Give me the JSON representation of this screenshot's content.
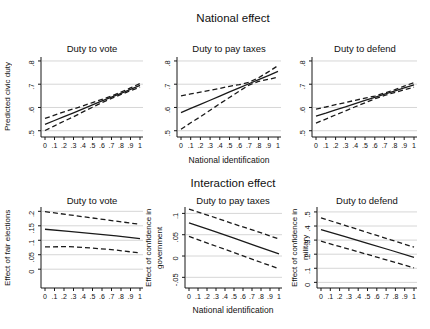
{
  "titles": {
    "national": "National effect",
    "interaction": "Interaction effect"
  },
  "colors": {
    "line": "#1a1a1a",
    "axis": "#161616",
    "grid": "#d6d6d6",
    "background": "#ffffff",
    "text": "#111111"
  },
  "chart_data": [
    {
      "id": "national-duty-to-vote",
      "type": "line",
      "group": "National effect",
      "title": "Duty to vote",
      "ylabel": "Predicted civic duty",
      "ylabel_lines": [
        "Predicted civic duty"
      ],
      "xlabel": "",
      "x": [
        0,
        0.1,
        0.2,
        0.3,
        0.4,
        0.5,
        0.6,
        0.7,
        0.8,
        0.9,
        1
      ],
      "series": [
        {
          "name": "point-estimate",
          "style": "solid",
          "values": [
            0.527,
            0.544,
            0.561,
            0.577,
            0.594,
            0.611,
            0.628,
            0.644,
            0.661,
            0.678,
            0.695
          ]
        },
        {
          "name": "upper-ci",
          "style": "dashed",
          "values": [
            0.553,
            0.567,
            0.581,
            0.594,
            0.607,
            0.621,
            0.635,
            0.649,
            0.666,
            0.684,
            0.703
          ]
        },
        {
          "name": "lower-ci",
          "style": "dashed",
          "values": [
            0.501,
            0.521,
            0.541,
            0.56,
            0.581,
            0.601,
            0.621,
            0.639,
            0.656,
            0.672,
            0.687
          ]
        }
      ],
      "ylim": [
        0.473,
        0.817
      ],
      "yticks": [
        0.5,
        0.6,
        0.7,
        0.8
      ],
      "ytick_labels": [
        ".5",
        ".6",
        ".7",
        ".8"
      ],
      "xticks": [
        0,
        0.1,
        0.2,
        0.3,
        0.4,
        0.5,
        0.6,
        0.7,
        0.8,
        0.9,
        1
      ],
      "xtick_labels": [
        "0",
        ".1",
        ".2",
        ".3",
        ".4",
        ".5",
        ".6",
        ".7",
        ".8",
        ".9",
        "1"
      ],
      "grid": true
    },
    {
      "id": "national-duty-to-pay-taxes",
      "type": "line",
      "group": "National effect",
      "title": "Duty to pay taxes",
      "ylabel": "",
      "ylabel_lines": [],
      "xlabel": "National identification",
      "x": [
        0,
        0.1,
        0.2,
        0.3,
        0.4,
        0.5,
        0.6,
        0.7,
        0.8,
        0.9,
        1
      ],
      "series": [
        {
          "name": "point-estimate",
          "style": "solid",
          "values": [
            0.578,
            0.596,
            0.613,
            0.631,
            0.649,
            0.667,
            0.684,
            0.702,
            0.72,
            0.737,
            0.755
          ]
        },
        {
          "name": "upper-ci",
          "style": "dashed",
          "values": [
            0.65,
            0.658,
            0.666,
            0.674,
            0.682,
            0.691,
            0.698,
            0.708,
            0.728,
            0.753,
            0.78
          ]
        },
        {
          "name": "lower-ci",
          "style": "dashed",
          "values": [
            0.506,
            0.534,
            0.56,
            0.588,
            0.616,
            0.643,
            0.67,
            0.696,
            0.712,
            0.721,
            0.73
          ]
        }
      ],
      "ylim": [
        0.473,
        0.817
      ],
      "yticks": [
        0.5,
        0.6,
        0.7,
        0.8
      ],
      "ytick_labels": [
        ".5",
        ".6",
        ".7",
        ".8"
      ],
      "xticks": [
        0,
        0.1,
        0.2,
        0.3,
        0.4,
        0.5,
        0.6,
        0.7,
        0.8,
        0.9,
        1
      ],
      "xtick_labels": [
        "0",
        ".1",
        ".2",
        ".3",
        ".4",
        ".5",
        ".6",
        ".7",
        ".8",
        ".9",
        "1"
      ],
      "grid": true
    },
    {
      "id": "national-duty-to-defend",
      "type": "line",
      "group": "National effect",
      "title": "Duty to defend",
      "ylabel": "",
      "ylabel_lines": [],
      "xlabel": "",
      "x": [
        0,
        0.1,
        0.2,
        0.3,
        0.4,
        0.5,
        0.6,
        0.7,
        0.8,
        0.9,
        1
      ],
      "series": [
        {
          "name": "point-estimate",
          "style": "solid",
          "values": [
            0.563,
            0.576,
            0.59,
            0.603,
            0.617,
            0.63,
            0.643,
            0.657,
            0.67,
            0.684,
            0.697
          ]
        },
        {
          "name": "upper-ci",
          "style": "dashed",
          "values": [
            0.593,
            0.602,
            0.612,
            0.621,
            0.631,
            0.64,
            0.649,
            0.662,
            0.676,
            0.692,
            0.707
          ]
        },
        {
          "name": "lower-ci",
          "style": "dashed",
          "values": [
            0.533,
            0.55,
            0.568,
            0.585,
            0.603,
            0.62,
            0.637,
            0.652,
            0.664,
            0.676,
            0.687
          ]
        }
      ],
      "ylim": [
        0.473,
        0.817
      ],
      "yticks": [
        0.5,
        0.6,
        0.7,
        0.8
      ],
      "ytick_labels": [
        ".5",
        ".6",
        ".7",
        ".8"
      ],
      "xticks": [
        0,
        0.1,
        0.2,
        0.3,
        0.4,
        0.5,
        0.6,
        0.7,
        0.8,
        0.9,
        1
      ],
      "xtick_labels": [
        "0",
        ".1",
        ".2",
        ".3",
        ".4",
        ".5",
        ".6",
        ".7",
        ".8",
        ".9",
        "1"
      ],
      "grid": true
    },
    {
      "id": "interaction-duty-to-vote",
      "type": "line",
      "group": "Interaction effect",
      "title": "Duty to vote",
      "ylabel": "Effect of fair elections",
      "ylabel_lines": [
        "Effect of fair elections"
      ],
      "xlabel": "",
      "x": [
        0,
        0.25,
        0.5,
        0.75,
        1
      ],
      "series": [
        {
          "name": "point-estimate",
          "style": "solid",
          "values": [
            0.138,
            0.131,
            0.123,
            0.115,
            0.106
          ]
        },
        {
          "name": "upper-ci",
          "style": "dashed",
          "values": [
            0.199,
            0.188,
            0.177,
            0.166,
            0.155
          ]
        },
        {
          "name": "lower-ci",
          "style": "dashed",
          "values": [
            0.077,
            0.078,
            0.073,
            0.066,
            0.056
          ]
        }
      ],
      "ylim": [
        -0.065,
        0.215
      ],
      "yticks": [
        0,
        0.05,
        0.1,
        0.15,
        0.2
      ],
      "ytick_labels": [
        "0",
        ".05",
        ".1",
        ".15",
        ".2"
      ],
      "xticks": [
        0,
        0.1,
        0.2,
        0.3,
        0.4,
        0.5,
        0.6,
        0.7,
        0.8,
        0.9,
        1
      ],
      "xtick_labels": [
        "0",
        ".1",
        ".2",
        ".3",
        ".4",
        ".5",
        ".6",
        ".7",
        ".8",
        ".9",
        "1"
      ],
      "grid": true
    },
    {
      "id": "interaction-duty-to-pay-taxes",
      "type": "line",
      "group": "Interaction effect",
      "title": "Duty to pay taxes",
      "ylabel": "Effect of confidence in government",
      "ylabel_lines": [
        "Effect of confidence in",
        "government"
      ],
      "xlabel": "National identification",
      "x": [
        0,
        0.25,
        0.5,
        0.75,
        1
      ],
      "series": [
        {
          "name": "point-estimate",
          "style": "solid",
          "values": [
            0.078,
            0.06,
            0.042,
            0.023,
            0.005
          ]
        },
        {
          "name": "upper-ci",
          "style": "dashed",
          "values": [
            0.11,
            0.093,
            0.075,
            0.058,
            0.04
          ]
        },
        {
          "name": "lower-ci",
          "style": "dashed",
          "values": [
            0.046,
            0.027,
            0.008,
            -0.011,
            -0.03
          ]
        }
      ],
      "ylim": [
        -0.075,
        0.115
      ],
      "yticks": [
        -0.05,
        0,
        0.05,
        0.1
      ],
      "ytick_labels": [
        "-.05",
        "0",
        ".05",
        ".1"
      ],
      "xticks": [
        0,
        0.1,
        0.2,
        0.3,
        0.4,
        0.5,
        0.6,
        0.7,
        0.8,
        0.9,
        1
      ],
      "xtick_labels": [
        "0",
        ".1",
        ".2",
        ".3",
        ".4",
        ".5",
        ".6",
        ".7",
        ".8",
        ".9",
        "1"
      ],
      "grid": true
    },
    {
      "id": "interaction-duty-to-defend",
      "type": "line",
      "group": "Interaction effect",
      "title": "Duty to defend",
      "ylabel": "Effect of confidence in military",
      "ylabel_lines": [
        "Effect of confidence in military"
      ],
      "xlabel": "",
      "x": [
        0,
        0.25,
        0.5,
        0.75,
        1
      ],
      "series": [
        {
          "name": "point-estimate",
          "style": "solid",
          "values": [
            0.375,
            0.326,
            0.277,
            0.228,
            0.178
          ]
        },
        {
          "name": "upper-ci",
          "style": "dashed",
          "values": [
            0.458,
            0.406,
            0.354,
            0.302,
            0.25
          ]
        },
        {
          "name": "lower-ci",
          "style": "dashed",
          "values": [
            0.292,
            0.245,
            0.198,
            0.151,
            0.103
          ]
        }
      ],
      "ylim": [
        -0.04,
        0.535
      ],
      "yticks": [
        0,
        0.1,
        0.2,
        0.3,
        0.4,
        0.5
      ],
      "ytick_labels": [
        "0",
        ".1",
        ".2",
        ".3",
        ".4",
        ".5"
      ],
      "xticks": [
        0,
        0.1,
        0.2,
        0.3,
        0.4,
        0.5,
        0.6,
        0.7,
        0.8,
        0.9,
        1
      ],
      "xtick_labels": [
        "0",
        ".1",
        ".2",
        ".3",
        ".4",
        ".5",
        ".6",
        ".7",
        ".8",
        ".9",
        "1"
      ],
      "grid": true
    }
  ]
}
